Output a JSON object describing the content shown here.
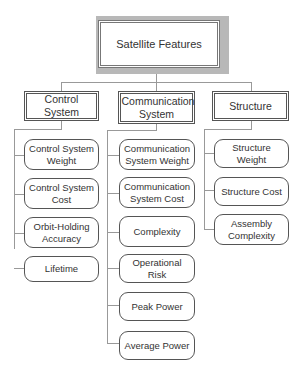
{
  "root": {
    "label": "Satellite Features"
  },
  "categories": [
    {
      "label": "Control System",
      "children": [
        "Control System Weight",
        "Control System Cost",
        "Orbit-Holding Accuracy",
        "Lifetime"
      ]
    },
    {
      "label": "Communication System",
      "children": [
        "Communication System Weight",
        "Communication System Cost",
        "Complexity",
        "Operational Risk",
        "Peak Power",
        "Average Power"
      ]
    },
    {
      "label": "Structure",
      "children": [
        "Structure Weight",
        "Structure Cost",
        "Assembly Complexity"
      ]
    }
  ]
}
